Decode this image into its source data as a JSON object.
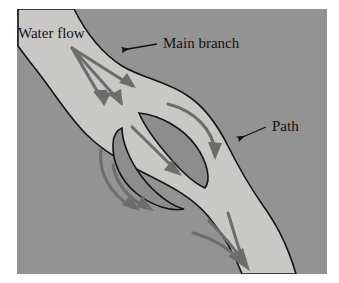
{
  "figure": {
    "background_color": "#ffffff",
    "plate_color": "#939393",
    "channel_fill": "#c9c8c4",
    "island_fill": "#8d8d8d",
    "outline_color": "#141414",
    "arrow_color": "#6d6d6d",
    "leader_color": "#111111",
    "text_color": "#111111"
  },
  "labels": {
    "water_flow": "Water flow",
    "main_branch": "Main branch",
    "path": "Path"
  },
  "annotations": [
    {
      "name": "water-flow",
      "text": "Water flow",
      "x": 18,
      "y": 38,
      "font_size": 15,
      "has_leader": false
    },
    {
      "name": "main-branch",
      "text": "Main branch",
      "x": 163,
      "y": 48,
      "font_size": 15,
      "has_leader": true,
      "leader": {
        "from_x": 157,
        "from_y": 44,
        "to_x": 122,
        "to_y": 50
      }
    },
    {
      "name": "path",
      "text": "Path",
      "x": 272,
      "y": 131,
      "font_size": 15,
      "has_leader": true,
      "leader": {
        "from_x": 266,
        "from_y": 127,
        "to_x": 238,
        "to_y": 139
      }
    }
  ],
  "channel": {
    "description": "Braided stream flowing from upper-left to lower-right, widening around two lens-shaped mid-channel bars",
    "flow_direction": "northwest-to-southeast"
  },
  "islands": [
    {
      "name": "upper-right-bar",
      "description": "Lens-shaped mid-channel bar, upper right of the braid"
    },
    {
      "name": "lower-left-bar",
      "description": "Lens-shaped mid-channel bar, lower left of the braid"
    }
  ],
  "flow_arrows": [
    {
      "name": "inflow-arrow-1",
      "region": "upper-left",
      "curvature": "straight"
    },
    {
      "name": "inflow-arrow-2",
      "region": "upper-left",
      "curvature": "straight"
    },
    {
      "name": "inflow-arrow-3",
      "region": "upper-left",
      "curvature": "straight"
    },
    {
      "name": "center-arrow",
      "region": "between-bars",
      "curvature": "straight"
    },
    {
      "name": "right-branch-arrow",
      "region": "right-of-upper-bar",
      "curvature": "curved"
    },
    {
      "name": "left-branch-arrow-outer",
      "region": "left-of-lower-bar",
      "curvature": "curved"
    },
    {
      "name": "left-branch-arrow-inner",
      "region": "left-of-lower-bar",
      "curvature": "curved"
    },
    {
      "name": "outflow-arrow-1",
      "region": "lower-right",
      "curvature": "curved"
    },
    {
      "name": "outflow-arrow-2",
      "region": "lower-right",
      "curvature": "curved"
    },
    {
      "name": "outflow-arrow-3",
      "region": "lower-right",
      "curvature": "curved"
    }
  ]
}
